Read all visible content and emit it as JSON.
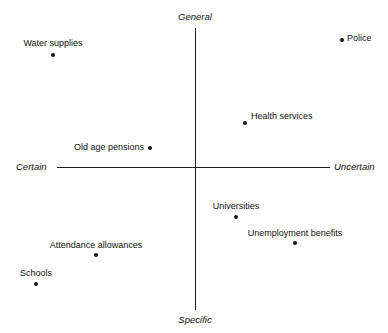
{
  "chart_data": {
    "type": "scatter",
    "title": "",
    "xlabel": "",
    "ylabel": "",
    "xlim": [
      -1,
      1
    ],
    "ylim": [
      -1,
      1
    ],
    "grid": false,
    "legend": null,
    "axis_endpoint_labels": {
      "top": "General",
      "bottom": "Specific",
      "left": "Certain",
      "right": "Uncertain"
    },
    "categories": [
      "Police",
      "Water supplies",
      "Health services",
      "Old age pensions",
      "Universities",
      "Unemployment benefits",
      "Attendance allowances",
      "Schools"
    ],
    "points": [
      {
        "label": "Police",
        "x": 0.88,
        "y": 0.9,
        "px": 342,
        "py": 40,
        "label_px": 347,
        "label_py": 33,
        "anchor": "left"
      },
      {
        "label": "Water supplies",
        "x": -0.91,
        "y": 0.79,
        "px": 53,
        "py": 55,
        "label_px": 53,
        "label_py": 38,
        "anchor": "center"
      },
      {
        "label": "Health services",
        "x": 0.34,
        "y": 0.31,
        "px": 245,
        "py": 123,
        "label_px": 251,
        "label_py": 111,
        "anchor": "left"
      },
      {
        "label": "Old age pensions",
        "x": -0.31,
        "y": 0.13,
        "px": 150,
        "py": 148,
        "label_px": 144,
        "label_py": 142,
        "anchor": "right"
      },
      {
        "label": "Universities",
        "x": 0.27,
        "y": -0.33,
        "px": 236,
        "py": 217,
        "label_px": 236,
        "label_py": 201,
        "anchor": "center"
      },
      {
        "label": "Unemployment benefits",
        "x": 0.68,
        "y": -0.51,
        "px": 295,
        "py": 243,
        "label_px": 295,
        "label_py": 228,
        "anchor": "center"
      },
      {
        "label": "Attendance allowances",
        "x": -0.7,
        "y": -0.6,
        "px": 96,
        "py": 255,
        "label_px": 96,
        "label_py": 240,
        "anchor": "center"
      },
      {
        "label": "Schools",
        "x": -0.96,
        "y": -0.8,
        "px": 36,
        "py": 284,
        "label_px": 36,
        "label_py": 268,
        "anchor": "center"
      }
    ],
    "axes_geometry": {
      "origin_x": 195,
      "origin_y": 167,
      "vertical_top": 28,
      "vertical_bottom": 310,
      "horizontal_left": 57,
      "horizontal_right": 330
    },
    "colors": {
      "point": "#141414",
      "axis": "#1a1a1a",
      "text": "#111111",
      "background": "#ffffff"
    }
  }
}
